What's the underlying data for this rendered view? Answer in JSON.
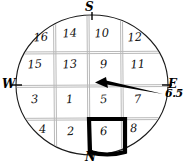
{
  "diagram": {
    "shape": "circle",
    "compass": {
      "top": "S",
      "bottom": "N",
      "left": "W",
      "right": "E"
    },
    "reading_label": "6.5",
    "grid": {
      "rows": 4,
      "cols": 4,
      "cells": [
        {
          "value": "16",
          "row": 0,
          "col": 0,
          "x": 41,
          "y": 41,
          "highlighted": false
        },
        {
          "value": "14",
          "row": 0,
          "col": 1,
          "x": 70,
          "y": 37,
          "highlighted": false
        },
        {
          "value": "10",
          "row": 0,
          "col": 2,
          "x": 102,
          "y": 37,
          "highlighted": false
        },
        {
          "value": "12",
          "row": 0,
          "col": 3,
          "x": 135,
          "y": 41,
          "highlighted": false
        },
        {
          "value": "15",
          "row": 1,
          "col": 0,
          "x": 35,
          "y": 68,
          "highlighted": false
        },
        {
          "value": "13",
          "row": 1,
          "col": 1,
          "x": 70,
          "y": 68,
          "highlighted": false
        },
        {
          "value": "9",
          "row": 1,
          "col": 2,
          "x": 104,
          "y": 68,
          "highlighted": false
        },
        {
          "value": "11",
          "row": 1,
          "col": 3,
          "x": 138,
          "y": 68,
          "highlighted": false
        },
        {
          "value": "3",
          "row": 2,
          "col": 0,
          "x": 35,
          "y": 103,
          "highlighted": false
        },
        {
          "value": "1",
          "row": 2,
          "col": 1,
          "x": 70,
          "y": 103,
          "highlighted": false
        },
        {
          "value": "5",
          "row": 2,
          "col": 2,
          "x": 104,
          "y": 103,
          "highlighted": false
        },
        {
          "value": "7",
          "row": 2,
          "col": 3,
          "x": 138,
          "y": 103,
          "highlighted": false
        },
        {
          "value": "4",
          "row": 3,
          "col": 0,
          "x": 43,
          "y": 133,
          "highlighted": false
        },
        {
          "value": "2",
          "row": 3,
          "col": 1,
          "x": 71,
          "y": 135,
          "highlighted": false
        },
        {
          "value": "6",
          "row": 3,
          "col": 2,
          "x": 104,
          "y": 135,
          "highlighted": true
        },
        {
          "value": "8",
          "row": 3,
          "col": 3,
          "x": 134,
          "y": 132,
          "highlighted": false
        }
      ]
    },
    "arrow": {
      "name": "direction-arrow",
      "from_side": "east",
      "points_to": "center"
    },
    "colors": {
      "ink": "#000000",
      "grid_line": "#b9b9b9",
      "circle_outline": "#1a1a1a",
      "background": "#ffffff"
    }
  }
}
